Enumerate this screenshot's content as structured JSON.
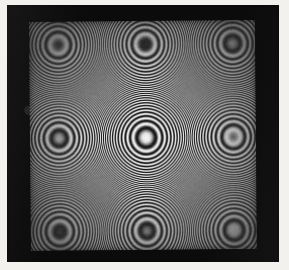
{
  "image": {
    "title": "Newton's rings interferogram",
    "subject": "concentric circular interference fringes",
    "medium": "black and white photographic print",
    "caption_text": ""
  },
  "canvas": {
    "width": 289,
    "height": 270
  },
  "paper": {
    "color": "#f2f1ee",
    "margin_left": 7,
    "margin_top": 5,
    "margin_right": 10,
    "margin_bottom": 8
  },
  "frame": {
    "name": "photographic-border",
    "color": "#0b0b0b",
    "x": 7,
    "y": 5,
    "width": 272,
    "height": 257
  },
  "aperture": {
    "name": "interferogram-field",
    "x": 30,
    "y": 21,
    "width": 226,
    "height": 229,
    "rotation_deg": -0.5,
    "background": "#8d8d8d"
  },
  "colors": {
    "paper": "#f2f1ee",
    "frame_black": "#0b0b0b",
    "fringe_bright": "#f0f0f0",
    "fringe_dark": "#0d0d0d",
    "field_mid_gray": "#8d8d8d",
    "center_highlight": "#efefef"
  },
  "chart_data": {
    "type": "heatmap",
    "subtitle": "circular equal-thickness interference fringes",
    "xlabel": "",
    "ylabel": "",
    "pattern": "concentric-circular-fringes",
    "intensity_model": "I = 0.5 + 0.5*cos(k * r^2)",
    "center_x_px": 145.5,
    "center_y_px": 137.0,
    "center_x_frac": 0.512,
    "center_y_frac": 0.507,
    "ellipticity_x": 1.0,
    "ellipticity_y": 1.035,
    "central_bright_disc_radius_px": 13,
    "fringe_order_radius_constant_px": 13.2,
    "radius_law": "r_n = c * sqrt(n)",
    "visible_dark_fringe_count": 58,
    "contrast_falloff_radius_px": 150,
    "dark_ring_radii_px": [
      13,
      19,
      23,
      26,
      30,
      32,
      35,
      37,
      40,
      42,
      44,
      46,
      48,
      50,
      51,
      53,
      55,
      56,
      58,
      59,
      61,
      62,
      63,
      65,
      66,
      67,
      69,
      70,
      71,
      72,
      73,
      75,
      76,
      77,
      78,
      79,
      80,
      81,
      82,
      83,
      84,
      85,
      86,
      87,
      88,
      89,
      90,
      91,
      92,
      93,
      94,
      95,
      96,
      97,
      98,
      99,
      100,
      101
    ],
    "grid": false,
    "legend": false,
    "axis_visible": false,
    "ylim": [
      0,
      1
    ]
  }
}
